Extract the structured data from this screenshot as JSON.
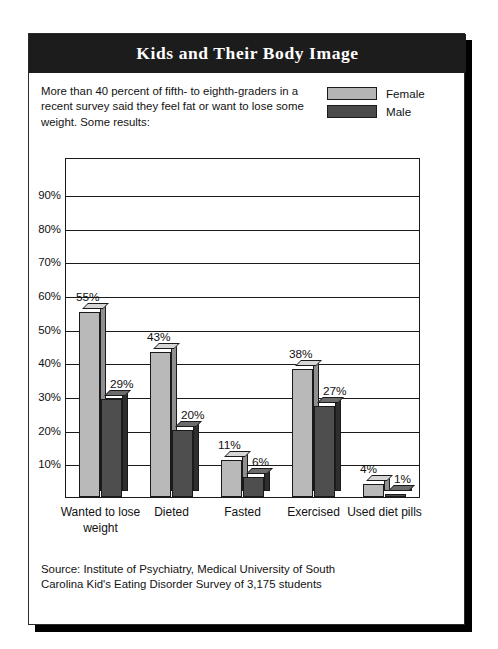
{
  "title": "Kids and Their Body Image",
  "intro": "More than 40 percent of fifth- to eighth-graders in a recent survey said they feel fat or want to lose some weight. Some results:",
  "legend": [
    {
      "label": "Female",
      "color": "#b5b5b5"
    },
    {
      "label": "Male",
      "color": "#4a4a4a"
    }
  ],
  "source": "Source: Institute of Psychiatry, Medical University of South Carolina Kid's Eating Disorder Survey of 3,175 students",
  "axis": {
    "yticks": [
      "10%",
      "20%",
      "30%",
      "40%",
      "50%",
      "60%",
      "70%",
      "80%",
      "90%"
    ]
  },
  "chart_data": {
    "type": "bar",
    "title": "Kids and Their Body Image",
    "xlabel": "",
    "ylabel": "",
    "ylim": [
      0,
      101
    ],
    "grid": true,
    "legend_position": "top-right",
    "categories": [
      "Wanted to lose weight",
      "Dieted",
      "Fasted",
      "Exercised",
      "Used diet pills"
    ],
    "series": [
      {
        "name": "Female",
        "color": "#b9b9b9",
        "values": [
          55,
          43,
          11,
          38,
          4
        ],
        "labels": [
          "55%",
          "43%",
          "11%",
          "38%",
          "4%"
        ]
      },
      {
        "name": "Male",
        "color": "#4e4e4e",
        "values": [
          29,
          20,
          6,
          27,
          1
        ],
        "labels": [
          "29%",
          "20%",
          "6%",
          "27%",
          "1%"
        ]
      }
    ],
    "yticks": [
      10,
      20,
      30,
      40,
      50,
      60,
      70,
      80,
      90
    ],
    "ytick_labels": [
      "10%",
      "20%",
      "30%",
      "40%",
      "50%",
      "60%",
      "70%",
      "80%",
      "90%"
    ],
    "annotations": [
      "Source: Institute of Psychiatry, Medical University of South Carolina Kid's Eating Disorder Survey of 3,175 students"
    ]
  }
}
